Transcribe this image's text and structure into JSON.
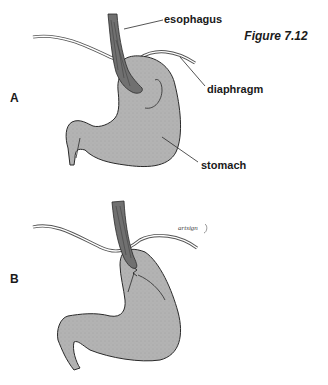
{
  "figure": {
    "title": "Figure 7.12"
  },
  "panels": [
    {
      "id": "A",
      "label": "A",
      "callouts": [
        {
          "target": "esophagus",
          "text": "esophagus"
        },
        {
          "target": "diaphragm",
          "text": "diaphragm"
        },
        {
          "target": "stomach",
          "text": "stomach"
        }
      ]
    },
    {
      "id": "B",
      "label": "B",
      "signature": "artist signature"
    }
  ],
  "colors": {
    "stomach_fill": "#b3b3b3",
    "esophagus_fill": "#707070",
    "outline": "#2a2a2a",
    "diaphragm_line": "#555555"
  }
}
